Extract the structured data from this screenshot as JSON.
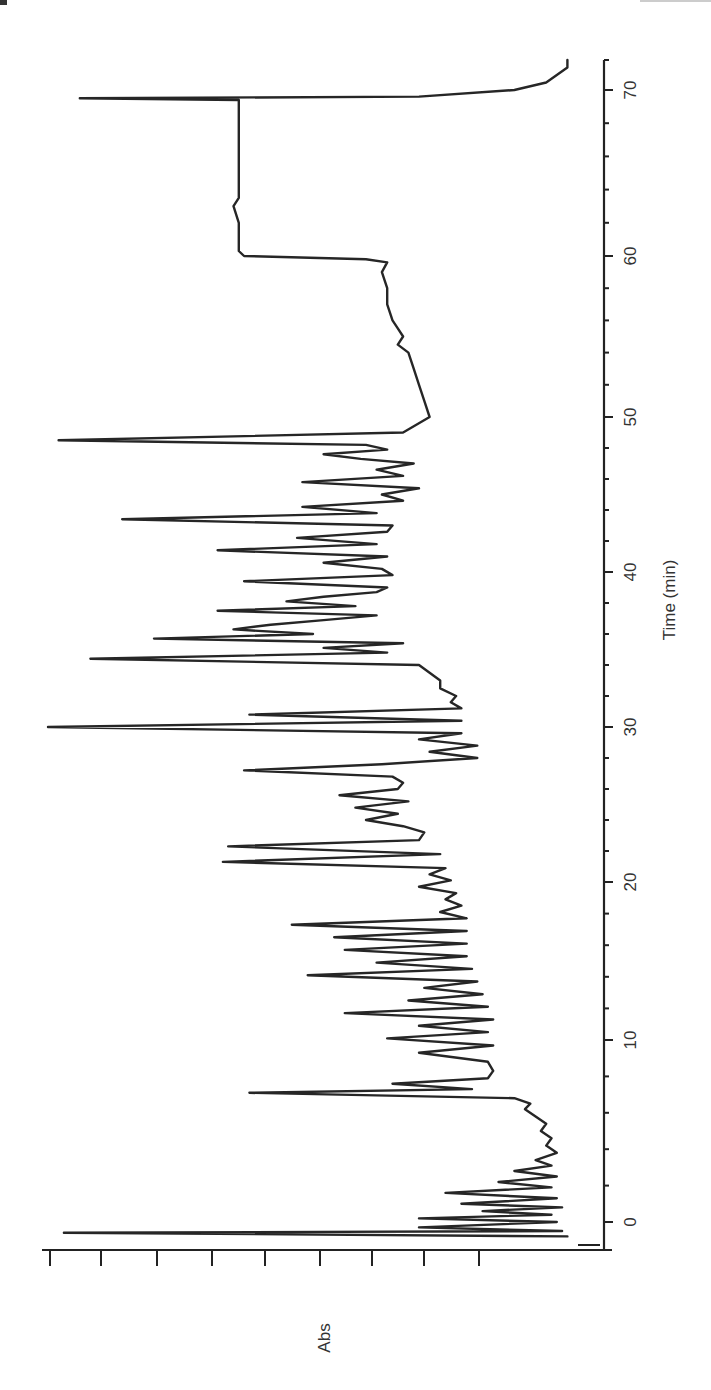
{
  "chart_data": {
    "type": "line",
    "orientation": "rotated-90 (time axis vertical on right, increasing upward; absorbance increases to the left)",
    "title": "",
    "xlabel": "Time (min)",
    "ylabel": "Abs",
    "xlim": [
      -1,
      72
    ],
    "ylim": [
      0,
      1
    ],
    "x_ticks_major": [
      0,
      10,
      20,
      30,
      40,
      50,
      60,
      70
    ],
    "x_tick_labels": [
      "0",
      "10",
      "20",
      "30",
      "40",
      "50",
      "60",
      "70"
    ],
    "x_minor_tick_interval": 2,
    "y_tick_count": 9,
    "y_tick_labels": [],
    "grid": false,
    "legend": null,
    "series": [
      {
        "name": "Abs",
        "x": [
          -0.8,
          -0.6,
          -0.5,
          -0.3,
          0.0,
          0.2,
          0.4,
          0.6,
          0.8,
          1.0,
          1.3,
          1.6,
          1.9,
          2.2,
          2.5,
          2.8,
          3.1,
          3.4,
          3.8,
          4.2,
          4.6,
          5.0,
          5.4,
          5.8,
          6.2,
          6.5,
          6.8,
          7.1,
          7.3,
          7.6,
          7.9,
          8.3,
          8.8,
          9.3,
          9.7,
          10.1,
          10.5,
          10.9,
          11.3,
          11.7,
          12.1,
          12.5,
          12.9,
          13.3,
          13.7,
          14.1,
          14.5,
          14.9,
          15.3,
          15.7,
          16.1,
          16.5,
          16.9,
          17.3,
          17.7,
          18.1,
          18.5,
          18.9,
          19.3,
          19.7,
          20.1,
          20.5,
          20.9,
          21.3,
          21.8,
          22.3,
          22.7,
          23.2,
          23.6,
          24.0,
          24.4,
          24.8,
          25.2,
          25.6,
          26.0,
          26.4,
          26.8,
          27.2,
          27.6,
          28.0,
          28.4,
          28.8,
          29.2,
          29.6,
          30.0,
          30.4,
          30.8,
          31.2,
          31.6,
          32.0,
          32.5,
          33.0,
          33.5,
          34.0,
          34.4,
          34.8,
          35.1,
          35.4,
          35.7,
          36.0,
          36.3,
          36.6,
          36.9,
          37.2,
          37.5,
          37.8,
          38.1,
          38.4,
          38.7,
          39.0,
          39.4,
          39.8,
          40.2,
          40.6,
          41.0,
          41.4,
          41.8,
          42.2,
          42.6,
          43.0,
          43.4,
          43.8,
          44.2,
          44.6,
          45.0,
          45.4,
          45.8,
          46.2,
          46.6,
          47.0,
          47.3,
          47.6,
          47.9,
          48.2,
          48.5,
          49.0,
          50.0,
          51.0,
          52.0,
          53.0,
          54.0,
          54.5,
          55.0,
          55.5,
          56.0,
          57.0,
          58.0,
          59.0,
          59.6,
          59.8,
          60.0,
          60.3,
          61.0,
          62.0,
          63.0,
          63.5,
          64.0,
          65.0,
          66.0,
          67.0,
          68.0,
          69.0,
          69.4,
          69.5,
          69.6,
          70.0,
          70.5,
          71.0,
          71.5,
          72.0
        ],
        "y": [
          0.02,
          0.97,
          0.03,
          0.3,
          0.04,
          0.3,
          0.05,
          0.18,
          0.03,
          0.22,
          0.04,
          0.25,
          0.05,
          0.15,
          0.04,
          0.12,
          0.05,
          0.08,
          0.04,
          0.06,
          0.05,
          0.07,
          0.06,
          0.08,
          0.1,
          0.09,
          0.12,
          0.62,
          0.2,
          0.35,
          0.17,
          0.16,
          0.17,
          0.3,
          0.16,
          0.36,
          0.17,
          0.3,
          0.16,
          0.44,
          0.17,
          0.32,
          0.18,
          0.29,
          0.19,
          0.51,
          0.2,
          0.38,
          0.21,
          0.44,
          0.21,
          0.46,
          0.21,
          0.54,
          0.21,
          0.26,
          0.22,
          0.25,
          0.23,
          0.3,
          0.24,
          0.28,
          0.25,
          0.67,
          0.26,
          0.66,
          0.3,
          0.29,
          0.33,
          0.4,
          0.34,
          0.42,
          0.32,
          0.45,
          0.34,
          0.33,
          0.35,
          0.63,
          0.37,
          0.19,
          0.28,
          0.19,
          0.3,
          0.22,
          1.0,
          0.22,
          0.62,
          0.22,
          0.24,
          0.23,
          0.26,
          0.26,
          0.28,
          0.3,
          0.92,
          0.36,
          0.48,
          0.33,
          0.8,
          0.5,
          0.65,
          0.58,
          0.48,
          0.38,
          0.68,
          0.42,
          0.55,
          0.48,
          0.38,
          0.36,
          0.63,
          0.35,
          0.37,
          0.48,
          0.36,
          0.68,
          0.38,
          0.53,
          0.36,
          0.35,
          0.86,
          0.38,
          0.52,
          0.33,
          0.37,
          0.3,
          0.52,
          0.33,
          0.38,
          0.31,
          0.41,
          0.48,
          0.36,
          0.4,
          0.98,
          0.33,
          0.28,
          0.29,
          0.3,
          0.31,
          0.32,
          0.34,
          0.33,
          0.34,
          0.35,
          0.36,
          0.36,
          0.37,
          0.36,
          0.4,
          0.63,
          0.64,
          0.64,
          0.64,
          0.65,
          0.64,
          0.64,
          0.64,
          0.64,
          0.64,
          0.64,
          0.64,
          0.64,
          0.94,
          0.3,
          0.12,
          0.06,
          0.04,
          0.02,
          0.02
        ]
      }
    ]
  },
  "page_fragments": {
    "top_left": "4",
    "top_right": ""
  }
}
